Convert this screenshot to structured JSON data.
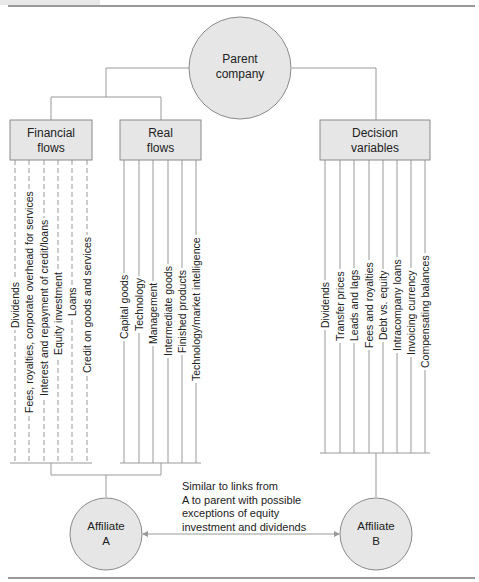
{
  "parent": {
    "line1": "Parent",
    "line2": "company"
  },
  "boxes": {
    "financial": {
      "line1": "Financial",
      "line2": "flows"
    },
    "real": {
      "line1": "Real",
      "line2": "flows"
    },
    "decision": {
      "line1": "Decision",
      "line2": "variables"
    }
  },
  "financial_flows": [
    "Dividends",
    "Fees, royalties, corporate overhead for services",
    "Interest and repayment of credit/loans",
    "Equity investment",
    "Loans",
    "Credit on goods and services"
  ],
  "real_flows": [
    "Capital goods",
    "Technology",
    "Management",
    "Intermediate goods",
    "Finished products",
    "Technology/market intelligence"
  ],
  "decision_variables": [
    "Dividends",
    "Transfer prices",
    "Leads and lags",
    "Fees and royalties",
    "Debt vs. equity",
    "Intracompany loans",
    "Invoicing currency",
    "Compensating balances"
  ],
  "affiliate_a": {
    "line1": "Affiliate",
    "line2": "A"
  },
  "affiliate_b": {
    "line1": "Affiliate",
    "line2": "B"
  },
  "note": {
    "line1": "Similar to links from",
    "line2": "A to parent with possible",
    "line3": "exceptions of equity",
    "line4": "investment and dividends"
  },
  "colors": {
    "fill": "#e6e6e6",
    "stroke": "#8a8a8a",
    "line": "#999999"
  }
}
